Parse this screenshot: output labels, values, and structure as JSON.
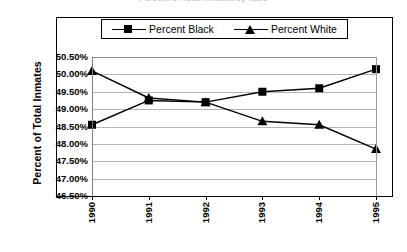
{
  "chart_title": "Percent of Total Inmates by Race",
  "axis": {
    "y_title": "Percent of Total Inmates",
    "y_tick_labels": [
      "50.50%",
      "50.00%",
      "49.50%",
      "49.00%",
      "48.50%",
      "48.00%",
      "47.50%",
      "47.00%",
      "46.50%"
    ],
    "x_tick_labels": [
      "1990",
      "1991",
      "1992",
      "1993",
      "1994",
      "1995"
    ]
  },
  "legend": {
    "entries": [
      {
        "label": "Percent Black",
        "marker": "square-marker-icon",
        "color": "#000000"
      },
      {
        "label": "Percent White",
        "marker": "triangle-marker-icon",
        "color": "#000000"
      }
    ]
  },
  "chart_data": {
    "type": "line",
    "title": "Percent of Total Inmates by Race",
    "xlabel": "",
    "ylabel": "Percent of Total Inmates",
    "categories": [
      "1990",
      "1991",
      "1992",
      "1993",
      "1994",
      "1995"
    ],
    "x": [
      1990,
      1991,
      1992,
      1993,
      1994,
      1995
    ],
    "ylim": [
      46.5,
      50.5
    ],
    "y_tick_values": [
      50.5,
      50.0,
      49.5,
      49.0,
      48.5,
      48.0,
      47.5,
      47.0,
      46.5
    ],
    "y_unit": "percent",
    "grid": true,
    "legend_position": "top-center",
    "series": [
      {
        "name": "Percent Black",
        "marker": "square",
        "color": "#000000",
        "values": [
          48.55,
          49.25,
          49.2,
          49.5,
          49.6,
          50.15
        ]
      },
      {
        "name": "Percent White",
        "marker": "triangle",
        "color": "#000000",
        "values": [
          50.1,
          49.32,
          49.2,
          48.65,
          48.55,
          47.85
        ]
      }
    ]
  }
}
